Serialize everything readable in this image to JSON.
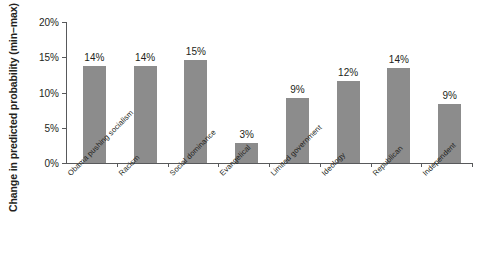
{
  "chart_data": {
    "type": "bar",
    "title": "",
    "xlabel": "",
    "ylabel": "Change in predicted probability (min–max)",
    "ylim": [
      0,
      20
    ],
    "ytick_labels": [
      "0%",
      "5%",
      "10%",
      "15%",
      "20%"
    ],
    "ytick_values": [
      0,
      5,
      10,
      15,
      20
    ],
    "grid": false,
    "legend": null,
    "bar_color": "#8c8c8c",
    "axis_color": "#58595b",
    "text_color": "#231f20",
    "categories": [
      "Obama pushing socialism",
      "Racism",
      "Social dominance",
      "Evangelical",
      "Limited government",
      "Ideology",
      "Republican",
      "Independent"
    ],
    "values": [
      13.8,
      13.8,
      14.6,
      2.9,
      9.2,
      11.6,
      13.5,
      8.4
    ],
    "data_labels": [
      "14%",
      "14%",
      "15%",
      "3%",
      "9%",
      "12%",
      "14%",
      "9%"
    ]
  }
}
